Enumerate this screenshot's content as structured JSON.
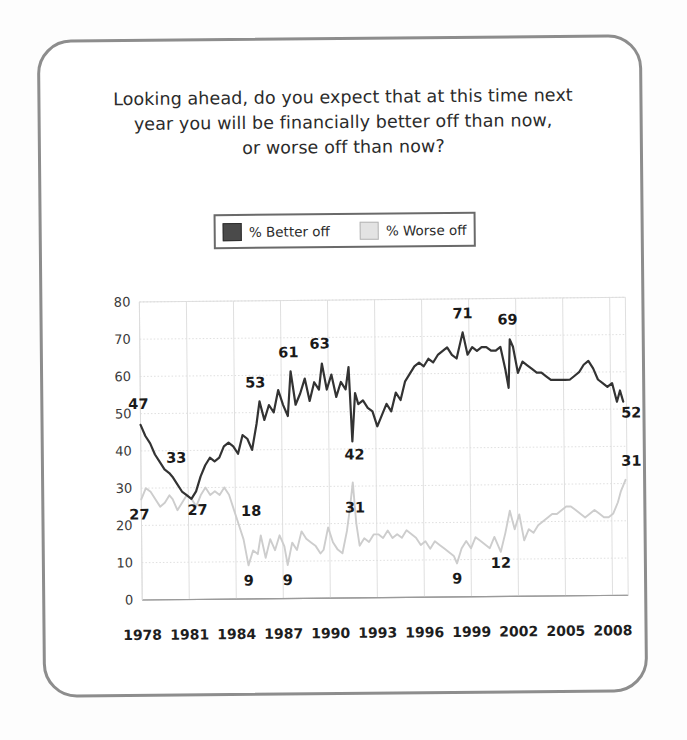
{
  "card": {
    "border_color": "#8d8d8d",
    "background": "#ffffff"
  },
  "title": {
    "line1": "Looking ahead, do you expect that at this time next",
    "line2": "year you will be financially better off than now,",
    "line3": "or worse off than now?"
  },
  "legend": {
    "position": "top-center",
    "entries": [
      {
        "label": "% Better off",
        "color": "#4a4a4a",
        "swatch": "dark-square-swatch"
      },
      {
        "label": "% Worse off",
        "color": "#e3e3e3",
        "swatch": "light-square-swatch"
      }
    ]
  },
  "chart_data": {
    "type": "line",
    "title": "Looking ahead, do you expect that at this time next year you will be financially better off than now, or worse off than now?",
    "xlabel": "",
    "ylabel": "",
    "ylim": [
      0,
      80
    ],
    "ytick_step": 10,
    "yticks": [
      0,
      10,
      20,
      30,
      40,
      50,
      60,
      70,
      80
    ],
    "xlim": [
      1978,
      2009
    ],
    "xticks": [
      1978,
      1981,
      1984,
      1987,
      1990,
      1993,
      1996,
      1999,
      2002,
      2005,
      2008
    ],
    "grid": true,
    "legend_position": "top-center",
    "annotations": [
      {
        "series": "% Better off",
        "x": 1978.0,
        "value": 47,
        "label": "47",
        "dx": -2,
        "dy": -16
      },
      {
        "series": "% Better off",
        "x": 1980.0,
        "value": 33,
        "label": "33",
        "dx": 4,
        "dy": -14
      },
      {
        "series": "% Better off",
        "x": 1981.2,
        "value": 27,
        "label": "27",
        "dx": 6,
        "dy": 16
      },
      {
        "series": "% Better off",
        "x": 1985.6,
        "value": 53,
        "label": "53",
        "dx": -4,
        "dy": -14
      },
      {
        "series": "% Better off",
        "x": 1987.6,
        "value": 61,
        "label": "61",
        "dx": -2,
        "dy": -14
      },
      {
        "series": "% Better off",
        "x": 1989.6,
        "value": 63,
        "label": "63",
        "dx": -2,
        "dy": -15
      },
      {
        "series": "% Better off",
        "x": 1991.5,
        "value": 42,
        "label": "42",
        "dx": 2,
        "dy": 18
      },
      {
        "series": "% Better off",
        "x": 1998.6,
        "value": 71,
        "label": "71",
        "dx": 0,
        "dy": -14
      },
      {
        "series": "% Better off",
        "x": 2001.6,
        "value": 69,
        "label": "69",
        "dx": -2,
        "dy": -15
      },
      {
        "series": "% Better off",
        "x": 2008.8,
        "value": 52,
        "label": "52",
        "dx": 8,
        "dy": 16
      },
      {
        "series": "% Worse off",
        "x": 1978.0,
        "value": 27,
        "label": "27",
        "dx": -2,
        "dy": 20
      },
      {
        "series": "% Worse off",
        "x": 1985.0,
        "value": 18,
        "label": "18",
        "dx": 0,
        "dy": -16
      },
      {
        "series": "% Worse off",
        "x": 1984.8,
        "value": 9,
        "label": "9",
        "dx": 0,
        "dy": 20
      },
      {
        "series": "% Worse off",
        "x": 1987.3,
        "value": 9,
        "label": "9",
        "dx": 0,
        "dy": 20
      },
      {
        "series": "% Worse off",
        "x": 1991.5,
        "value": 31,
        "label": "31",
        "dx": 2,
        "dy": 30
      },
      {
        "series": "% Worse off",
        "x": 1998.1,
        "value": 9,
        "label": "9",
        "dx": 0,
        "dy": 20
      },
      {
        "series": "% Worse off",
        "x": 2000.9,
        "value": 12,
        "label": "12",
        "dx": 0,
        "dy": 16
      },
      {
        "series": "% Worse off",
        "x": 2008.9,
        "value": 31,
        "label": "31",
        "dx": 6,
        "dy": -14
      }
    ],
    "series": [
      {
        "name": "% Better off",
        "color": "#333333",
        "x": [
          1978.0,
          1978.3,
          1978.6,
          1978.9,
          1979.2,
          1979.5,
          1979.8,
          1980.0,
          1980.3,
          1980.6,
          1980.9,
          1981.2,
          1981.5,
          1981.8,
          1982.1,
          1982.4,
          1982.7,
          1983.0,
          1983.3,
          1983.6,
          1983.9,
          1984.2,
          1984.5,
          1984.8,
          1985.1,
          1985.4,
          1985.6,
          1985.9,
          1986.2,
          1986.5,
          1986.8,
          1987.1,
          1987.4,
          1987.6,
          1987.9,
          1988.2,
          1988.5,
          1988.8,
          1989.1,
          1989.4,
          1989.6,
          1989.9,
          1990.2,
          1990.5,
          1990.8,
          1991.1,
          1991.3,
          1991.5,
          1991.7,
          1991.9,
          1992.2,
          1992.5,
          1992.8,
          1993.1,
          1993.4,
          1993.7,
          1994.0,
          1994.3,
          1994.6,
          1994.9,
          1995.2,
          1995.5,
          1995.8,
          1996.1,
          1996.4,
          1996.7,
          1997.0,
          1997.3,
          1997.6,
          1997.9,
          1998.2,
          1998.6,
          1998.9,
          1999.2,
          1999.5,
          1999.8,
          2000.1,
          2000.4,
          2000.7,
          2001.0,
          2001.3,
          2001.5,
          2001.6,
          2001.8,
          2002.1,
          2002.4,
          2002.7,
          2003.0,
          2003.3,
          2003.6,
          2003.9,
          2004.2,
          2004.5,
          2004.8,
          2005.1,
          2005.4,
          2005.7,
          2006.0,
          2006.3,
          2006.6,
          2006.9,
          2007.2,
          2007.5,
          2007.8,
          2008.1,
          2008.4,
          2008.6,
          2008.8
        ],
        "y": [
          47,
          44,
          42,
          39,
          37,
          35,
          34,
          33,
          31,
          29,
          28,
          27,
          29,
          33,
          36,
          38,
          37,
          38,
          41,
          42,
          41,
          39,
          44,
          43,
          40,
          47,
          53,
          48,
          52,
          50,
          56,
          52,
          49,
          61,
          52,
          55,
          59,
          53,
          58,
          56,
          63,
          56,
          60,
          54,
          58,
          56,
          62,
          42,
          55,
          52,
          53,
          51,
          50,
          46,
          49,
          52,
          50,
          55,
          53,
          58,
          60,
          62,
          63,
          62,
          64,
          63,
          65,
          66,
          67,
          65,
          64,
          71,
          65,
          67,
          66,
          67,
          67,
          66,
          66,
          67,
          61,
          56,
          69,
          67,
          60,
          63,
          62,
          61,
          60,
          60,
          59,
          58,
          58,
          58,
          58,
          58,
          59,
          60,
          62,
          63,
          61,
          58,
          57,
          56,
          57,
          52,
          55,
          52
        ]
      },
      {
        "name": "% Worse off",
        "color": "#cdcdcd",
        "x": [
          1978.0,
          1978.3,
          1978.6,
          1978.9,
          1979.2,
          1979.5,
          1979.8,
          1980.0,
          1980.3,
          1980.6,
          1980.9,
          1981.2,
          1981.5,
          1981.8,
          1982.1,
          1982.4,
          1982.7,
          1983.0,
          1983.3,
          1983.6,
          1983.9,
          1984.2,
          1984.5,
          1984.8,
          1985.1,
          1985.4,
          1985.6,
          1985.9,
          1986.2,
          1986.5,
          1986.8,
          1987.1,
          1987.3,
          1987.6,
          1987.9,
          1988.2,
          1988.5,
          1988.8,
          1989.1,
          1989.4,
          1989.6,
          1989.9,
          1990.2,
          1990.5,
          1990.8,
          1991.1,
          1991.3,
          1991.5,
          1991.7,
          1991.9,
          1992.2,
          1992.5,
          1992.8,
          1993.1,
          1993.4,
          1993.7,
          1994.0,
          1994.3,
          1994.6,
          1994.9,
          1995.2,
          1995.5,
          1995.8,
          1996.1,
          1996.4,
          1996.7,
          1997.0,
          1997.3,
          1997.6,
          1997.9,
          1998.1,
          1998.4,
          1998.7,
          1999.0,
          1999.3,
          1999.6,
          1999.9,
          2000.2,
          2000.5,
          2000.9,
          2001.2,
          2001.5,
          2001.8,
          2002.1,
          2002.4,
          2002.7,
          2003.0,
          2003.3,
          2003.6,
          2003.9,
          2004.2,
          2004.5,
          2004.8,
          2005.1,
          2005.4,
          2005.7,
          2006.0,
          2006.3,
          2006.6,
          2006.9,
          2007.2,
          2007.5,
          2007.8,
          2008.1,
          2008.4,
          2008.6,
          2008.9
        ],
        "y": [
          27,
          30,
          29,
          27,
          25,
          26,
          28,
          27,
          24,
          26,
          28,
          27,
          25,
          28,
          30,
          28,
          29,
          28,
          30,
          28,
          24,
          20,
          16,
          9,
          13,
          12,
          17,
          11,
          16,
          13,
          17,
          14,
          9,
          15,
          13,
          18,
          16,
          15,
          14,
          12,
          13,
          19,
          15,
          13,
          12,
          18,
          24,
          31,
          20,
          14,
          16,
          15,
          17,
          17,
          16,
          18,
          16,
          17,
          16,
          18,
          17,
          16,
          14,
          15,
          13,
          15,
          14,
          13,
          12,
          11,
          9,
          13,
          15,
          13,
          16,
          15,
          14,
          13,
          16,
          12,
          17,
          23,
          18,
          22,
          15,
          18,
          17,
          19,
          20,
          21,
          22,
          22,
          23,
          24,
          24,
          23,
          22,
          21,
          22,
          23,
          22,
          21,
          21,
          22,
          25,
          28,
          31
        ]
      }
    ]
  },
  "axis": {
    "y_labels": [
      "80",
      "70",
      "60",
      "50",
      "40",
      "30",
      "20",
      "10",
      "0"
    ],
    "x_labels": [
      "1978",
      "1981",
      "1984",
      "1987",
      "1990",
      "1993",
      "1996",
      "1999",
      "2002",
      "2005",
      "2008"
    ]
  }
}
